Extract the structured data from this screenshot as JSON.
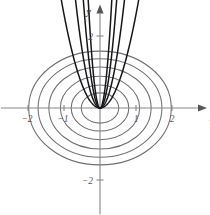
{
  "figure": {
    "kind": "math-plot",
    "background_color": "#ffffff",
    "width": 210,
    "height": 215
  },
  "axes": {
    "x_axis_name": "x",
    "y_axis_name": "y",
    "origin_px": {
      "x": 100,
      "y": 108
    },
    "unit_px": 36,
    "axis_color": "#87878a",
    "arrow_color": "#55555a",
    "x_ticks": [
      {
        "value": -2,
        "label": "−2"
      },
      {
        "value": -1,
        "label": "−1"
      },
      {
        "value": 1,
        "label": "1"
      },
      {
        "value": 2,
        "label": "2"
      }
    ],
    "y_ticks": [
      {
        "value": 2,
        "label": "2"
      },
      {
        "value": -2,
        "label": "−2"
      }
    ]
  },
  "chart_data": {
    "type": "line",
    "title": "",
    "xlabel": "x",
    "ylabel": "y",
    "xlim": [
      -2.75,
      3.0
    ],
    "ylim": [
      -2.95,
      2.9
    ],
    "grid": false,
    "legend": "none",
    "series": [
      {
        "name": "ellipse-1",
        "kind": "ellipse",
        "color": "#6f6f74",
        "center": [
          0,
          0
        ],
        "semi_axis_x": 0.52,
        "semi_axis_y": 0.42
      },
      {
        "name": "ellipse-2",
        "kind": "ellipse",
        "color": "#6f6f74",
        "center": [
          0,
          0
        ],
        "semi_axis_x": 0.8,
        "semi_axis_y": 0.64
      },
      {
        "name": "ellipse-3",
        "kind": "ellipse",
        "color": "#6f6f74",
        "center": [
          0,
          0
        ],
        "semi_axis_x": 1.1,
        "semi_axis_y": 0.88
      },
      {
        "name": "ellipse-4",
        "kind": "ellipse",
        "color": "#6f6f74",
        "center": [
          0,
          0
        ],
        "semi_axis_x": 1.42,
        "semi_axis_y": 1.14
      },
      {
        "name": "ellipse-5",
        "kind": "ellipse",
        "color": "#6f6f74",
        "center": [
          0,
          0
        ],
        "semi_axis_x": 1.72,
        "semi_axis_y": 1.37
      },
      {
        "name": "ellipse-6",
        "kind": "ellipse",
        "color": "#6f6f74",
        "center": [
          0,
          0
        ],
        "semi_axis_x": 1.98,
        "semi_axis_y": 1.58
      },
      {
        "name": "parabola-left-1",
        "kind": "parabola",
        "color": "#17171a",
        "coefficient": 28.0,
        "side": "left",
        "x_end": -0.33
      },
      {
        "name": "parabola-left-2",
        "kind": "parabola",
        "color": "#17171a",
        "coefficient": 14.0,
        "side": "left",
        "x_end": -0.47
      },
      {
        "name": "parabola-left-3",
        "kind": "parabola",
        "color": "#17171a",
        "coefficient": 6.5,
        "side": "left",
        "x_end": -0.7
      },
      {
        "name": "parabola-left-4",
        "kind": "parabola",
        "color": "#17171a",
        "coefficient": 2.6,
        "side": "left",
        "x_end": -1.14
      },
      {
        "name": "parabola-right-1",
        "kind": "parabola",
        "color": "#17171a",
        "coefficient": 28.0,
        "side": "right",
        "x_end": 0.33
      },
      {
        "name": "parabola-right-2",
        "kind": "parabola",
        "color": "#17171a",
        "coefficient": 14.0,
        "side": "right",
        "x_end": 0.47
      },
      {
        "name": "parabola-right-3",
        "kind": "parabola",
        "color": "#17171a",
        "coefficient": 6.5,
        "side": "right",
        "x_end": 0.7
      },
      {
        "name": "parabola-right-4",
        "kind": "parabola",
        "color": "#17171a",
        "coefficient": 2.6,
        "side": "right",
        "x_end": 1.14
      }
    ]
  }
}
